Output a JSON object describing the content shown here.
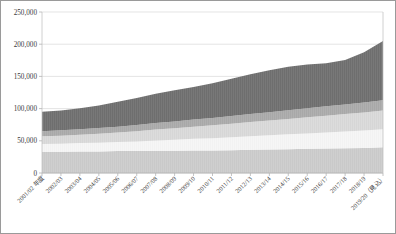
{
  "chart_data": {
    "type": "area",
    "stacked": true,
    "title": "",
    "subtitle": "",
    "xlabel": "",
    "ylabel": "",
    "ylim": [
      0,
      250000
    ],
    "yticks": [
      0,
      50000,
      100000,
      150000,
      200000,
      250000
    ],
    "ytick_labels": [
      "0",
      "50,000",
      "100,000",
      "150,000",
      "200,000",
      "250,000"
    ],
    "grid": true,
    "grid_axis": "y",
    "legend": "none",
    "categories": [
      "2001/02 年度",
      "2002/03",
      "2003/04",
      "2004/05",
      "2005/06",
      "2006/07",
      "2007/08",
      "2008/09",
      "2009/10",
      "2010/11",
      "2011/12",
      "2012/13",
      "2013/14",
      "2014/15",
      "2015/16",
      "2016/17",
      "2017/18",
      "2018/19",
      "2019/20（見込）"
    ],
    "series": [
      {
        "name": "series-1",
        "color": "#c9c9c9",
        "values": [
          33000,
          33000,
          33500,
          33500,
          34000,
          34000,
          34500,
          34500,
          35000,
          35000,
          35500,
          36000,
          36500,
          37000,
          37500,
          38000,
          38500,
          39000,
          40000
        ]
      },
      {
        "name": "series-2",
        "color": "#f2f2f2",
        "values": [
          12000,
          12500,
          13000,
          13500,
          14000,
          15000,
          16000,
          17000,
          18000,
          19000,
          20000,
          21000,
          22000,
          23000,
          24000,
          25000,
          26000,
          27000,
          28000
        ]
      },
      {
        "name": "series-3",
        "color": "#d6d6d6",
        "values": [
          12000,
          12500,
          13000,
          14000,
          15000,
          16000,
          17000,
          18000,
          19000,
          20000,
          21000,
          22000,
          23000,
          24000,
          25000,
          26000,
          27000,
          28000,
          29000
        ]
      },
      {
        "name": "series-4",
        "color": "#a8a8a8",
        "values": [
          8000,
          8200,
          8500,
          8800,
          9000,
          9500,
          10000,
          10500,
          11000,
          11500,
          12000,
          12500,
          13000,
          13500,
          14000,
          14500,
          15000,
          15500,
          16000
        ]
      },
      {
        "name": "series-5",
        "color": "#6e6e6e",
        "values": [
          30000,
          31000,
          32500,
          35000,
          38500,
          42000,
          45500,
          48500,
          50500,
          54000,
          58000,
          62000,
          65000,
          67500,
          68000,
          67000,
          69000,
          78000,
          92000
        ]
      }
    ],
    "totals": [
      95000,
      97200,
      100500,
      104800,
      110500,
      116500,
      123000,
      128500,
      133500,
      139500,
      146500,
      153500,
      159500,
      165000,
      168500,
      170500,
      175500,
      187500,
      205000
    ]
  },
  "axis": {
    "y_max_label": "250,000",
    "y_min_label": "0"
  }
}
